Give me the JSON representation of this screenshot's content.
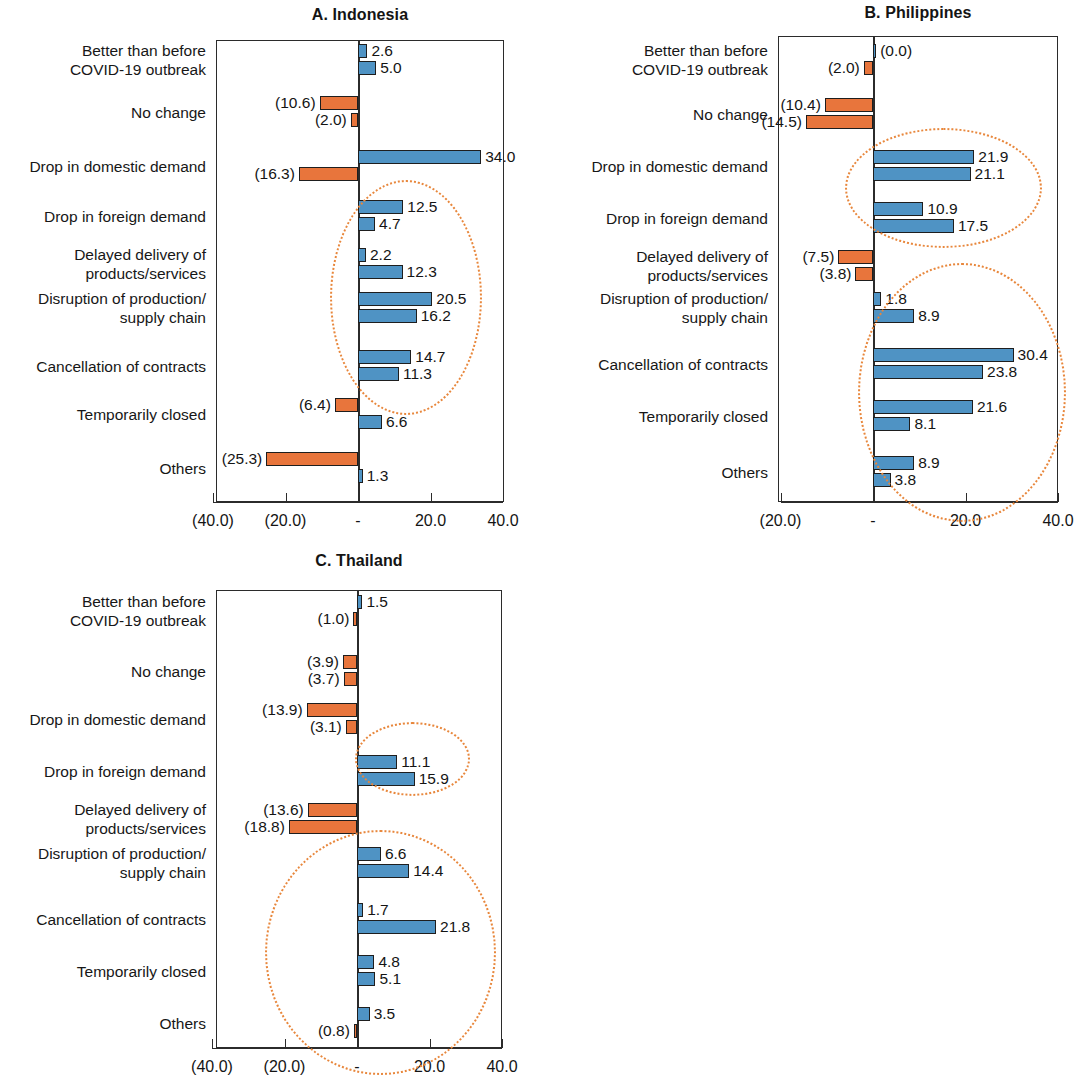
{
  "figure": {
    "accent_blue": "#4f93c4",
    "accent_orange": "#e8753c",
    "highlight_color": "#e8873c"
  },
  "chart_data": [
    {
      "type": "bar",
      "title": "A. Indonesia",
      "orientation": "horizontal",
      "xlabel": "",
      "ylabel": "",
      "xlim": [
        -50,
        50
      ],
      "grid": false,
      "legend": "none",
      "tick_labels": [
        "(40.0)",
        "(20.0)",
        "-",
        "20.0",
        "40.0"
      ],
      "tick_values": [
        -40,
        -20,
        0,
        20,
        40
      ],
      "categories": [
        "Better than before\nCOVID-19 outbreak",
        "No change",
        "Drop in domestic demand",
        "Drop in foreign demand",
        "Delayed delivery of\nproducts/services",
        "Disruption of production/\nsupply chain",
        "Cancellation of contracts",
        "Temporarily closed",
        "Others"
      ],
      "series": [
        {
          "name": "series-1",
          "values": [
            2.6,
            -10.6,
            34.0,
            12.5,
            2.2,
            20.5,
            14.7,
            -6.4,
            -25.3
          ],
          "labels": [
            "2.6",
            "(10.6)",
            "34.0",
            "12.5",
            "2.2",
            "20.5",
            "14.7",
            "(6.4)",
            "(25.3)"
          ]
        },
        {
          "name": "series-2",
          "values": [
            5.0,
            -2.0,
            -16.3,
            4.7,
            12.3,
            16.2,
            11.3,
            6.6,
            1.3
          ],
          "labels": [
            "5.0",
            "(2.0)",
            "(16.3)",
            "4.7",
            "12.3",
            "16.2",
            "11.3",
            "6.6",
            "1.3"
          ]
        }
      ],
      "annotations": [
        {
          "shape": "ellipse",
          "covers": [
            "Drop in foreign demand",
            "Delayed delivery of products/services",
            "Disruption of production/supply chain",
            "Cancellation of contracts"
          ]
        }
      ]
    },
    {
      "type": "bar",
      "title": "B. Philippines",
      "orientation": "horizontal",
      "xlabel": "",
      "ylabel": "",
      "xlim": [
        -30,
        50
      ],
      "grid": false,
      "legend": "none",
      "tick_labels": [
        "(20.0)",
        "-",
        "20.0",
        "40.0"
      ],
      "tick_values": [
        -20,
        0,
        20,
        40
      ],
      "categories": [
        "Better than before\nCOVID-19 outbreak",
        "No change",
        "Drop in domestic demand",
        "Drop in foreign demand",
        "Delayed delivery of\nproducts/services",
        "Disruption of production/\nsupply chain",
        "Cancellation of contracts",
        "Temporarily closed",
        "Others"
      ],
      "series": [
        {
          "name": "series-1",
          "values": [
            0.0,
            -10.4,
            21.9,
            10.9,
            -7.5,
            1.8,
            30.4,
            21.6,
            8.9
          ],
          "labels": [
            "(0.0)",
            "(10.4)",
            "21.9",
            "10.9",
            "(7.5)",
            "1.8",
            "30.4",
            "21.6",
            "8.9"
          ]
        },
        {
          "name": "series-2",
          "values": [
            -2.0,
            -14.5,
            21.1,
            17.5,
            -3.8,
            8.9,
            23.8,
            8.1,
            3.8
          ],
          "labels": [
            "(2.0)",
            "(14.5)",
            "21.1",
            "17.5",
            "(3.8)",
            "8.9",
            "23.8",
            "8.1",
            "3.8"
          ]
        }
      ],
      "annotations": [
        {
          "shape": "ellipse",
          "covers": [
            "Drop in domestic demand",
            "Drop in foreign demand"
          ]
        },
        {
          "shape": "ellipse",
          "covers": [
            "Disruption of production/supply chain",
            "Cancellation of contracts",
            "Temporarily closed",
            "Others"
          ]
        }
      ]
    },
    {
      "type": "bar",
      "title": "C. Thailand",
      "orientation": "horizontal",
      "xlabel": "",
      "ylabel": "",
      "xlim": [
        -50,
        50
      ],
      "grid": false,
      "legend": "none",
      "tick_labels": [
        "(40.0)",
        "(20.0)",
        "-",
        "20.0",
        "40.0"
      ],
      "tick_values": [
        -40,
        -20,
        0,
        20,
        40
      ],
      "categories": [
        "Better than before\nCOVID-19 outbreak",
        "No change",
        "Drop in domestic demand",
        "Drop in foreign demand",
        "Delayed delivery of\nproducts/services",
        "Disruption of production/\nsupply chain",
        "Cancellation of contracts",
        "Temporarily closed",
        "Others"
      ],
      "series": [
        {
          "name": "series-1",
          "values": [
            1.5,
            -3.9,
            -13.9,
            11.1,
            -13.6,
            6.6,
            1.7,
            4.8,
            3.5
          ],
          "labels": [
            "1.5",
            "(3.9)",
            "(13.9)",
            "11.1",
            "(13.6)",
            "6.6",
            "1.7",
            "4.8",
            "3.5"
          ]
        },
        {
          "name": "series-2",
          "values": [
            -1.0,
            -3.7,
            -3.1,
            15.9,
            -18.8,
            14.4,
            21.8,
            5.1,
            -0.8
          ],
          "labels": [
            "(1.0)",
            "(3.7)",
            "(3.1)",
            "15.9",
            "(18.8)",
            "14.4",
            "21.8",
            "5.1",
            "(0.8)"
          ]
        }
      ],
      "annotations": [
        {
          "shape": "ellipse",
          "covers": [
            "Drop in foreign demand"
          ]
        },
        {
          "shape": "ellipse",
          "covers": [
            "Disruption of production/supply chain",
            "Cancellation of contracts",
            "Temporarily closed",
            "Others"
          ]
        }
      ]
    }
  ]
}
